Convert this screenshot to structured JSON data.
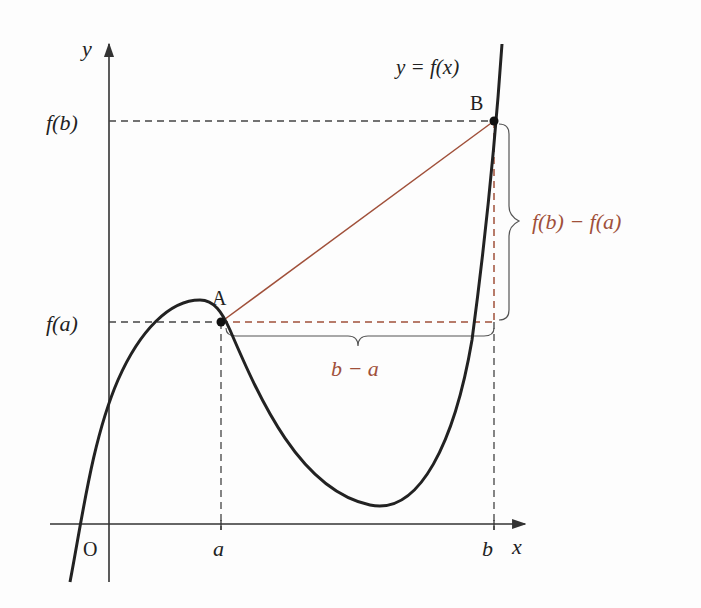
{
  "labels": {
    "y_axis": "y",
    "x_axis": "x",
    "origin": "O",
    "a_tick": "a",
    "b_tick": "b",
    "fa": "f(a)",
    "fb": "f(b)",
    "point_a": "A",
    "point_b": "B",
    "curve": "y = f(x)",
    "rise": "f(b) − f(a)",
    "run": "b − a"
  },
  "colors": {
    "curve": "#222222",
    "axes": "#333333",
    "accent": "#a0503a",
    "dashed": "#444444"
  }
}
